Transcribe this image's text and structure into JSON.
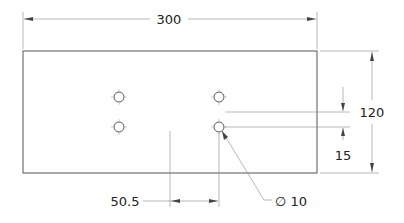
{
  "drawing": {
    "dimensions": {
      "overall_width": "300",
      "overall_height": "120",
      "hole_spacing_vertical": "15",
      "offset_horizontal": "50.5",
      "hole_diameter": "∅ 10"
    },
    "holes": [
      {
        "x": 119,
        "y": 97
      },
      {
        "x": 119,
        "y": 127
      },
      {
        "x": 219,
        "y": 97
      },
      {
        "x": 219,
        "y": 127
      }
    ],
    "colors": {
      "line": "#555555",
      "text": "#222222",
      "background": "#ffffff"
    }
  }
}
